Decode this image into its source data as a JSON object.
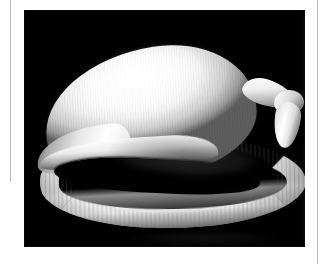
{
  "page": {
    "background_color": "#ffffff",
    "width": 329,
    "height": 264
  },
  "rules": {
    "color": "#b9b9b9",
    "left_rule_name": "left-column-rule",
    "right_rule_name": "right-column-rule"
  },
  "figure": {
    "plate_background_color": "#000000",
    "plate_left": 24,
    "plate_top": 10,
    "plate_width": 281,
    "plate_height": 237,
    "caption": "",
    "alt_text": "White seashell photographed against a solid black background"
  },
  "subject": {
    "name": "seashell",
    "common_name": "Egg cowrie shell",
    "color": "#ffffff",
    "orientation": "aperture facing viewer, anterior canal to the left",
    "parts": [
      {
        "id": "body-whorl",
        "label": "Body whorl",
        "color": "#ffffff"
      },
      {
        "id": "anterior-canal",
        "label": "Anterior canal",
        "color": "#f0f0f0"
      },
      {
        "id": "aperture",
        "label": "Aperture",
        "color": "#000000"
      },
      {
        "id": "outer-lip",
        "label": "Ribbed outer lip",
        "color": "#f2f2f2"
      },
      {
        "id": "posterior-canal",
        "label": "Posterior canal",
        "color": "#eaeaea"
      }
    ]
  }
}
